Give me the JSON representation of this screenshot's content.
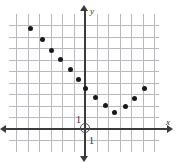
{
  "figure": {
    "kind": "coordinate-plane-scatter",
    "width": 178,
    "height": 162,
    "background": "#ffffff",
    "grid_color": "#b9b9bd",
    "axis_color": "#3a3a3a",
    "point_color": "#1a1a1a"
  },
  "labels": {
    "x_axis": "x",
    "y_axis": "y",
    "unit_y": "1",
    "unit_x": "1"
  },
  "chart_data": {
    "type": "scatter",
    "title": "",
    "xlabel": "x",
    "ylabel": "y",
    "grid": true,
    "legend": false,
    "xlim": [
      -6.6,
      6.4
    ],
    "ylim": [
      -2,
      10
    ],
    "x_tick_step": 1,
    "y_tick_step": 1,
    "labeled_ticks": {
      "x": [
        "1"
      ],
      "y": [
        "1"
      ]
    },
    "origin_marked": true,
    "points": [
      {
        "x": -4.7,
        "y": 8.7
      },
      {
        "x": -3.7,
        "y": 7.7
      },
      {
        "x": -2.9,
        "y": 6.8
      },
      {
        "x": -2.1,
        "y": 6.0
      },
      {
        "x": -1.3,
        "y": 5.1
      },
      {
        "x": -0.6,
        "y": 4.3
      },
      {
        "x": 0.05,
        "y": 3.5
      },
      {
        "x": 0.9,
        "y": 2.7
      },
      {
        "x": 1.8,
        "y": 2.0
      },
      {
        "x": 2.6,
        "y": 1.4
      },
      {
        "x": 3.5,
        "y": 1.9
      },
      {
        "x": 4.3,
        "y": 2.6
      },
      {
        "x": 5.2,
        "y": 3.5
      }
    ]
  }
}
